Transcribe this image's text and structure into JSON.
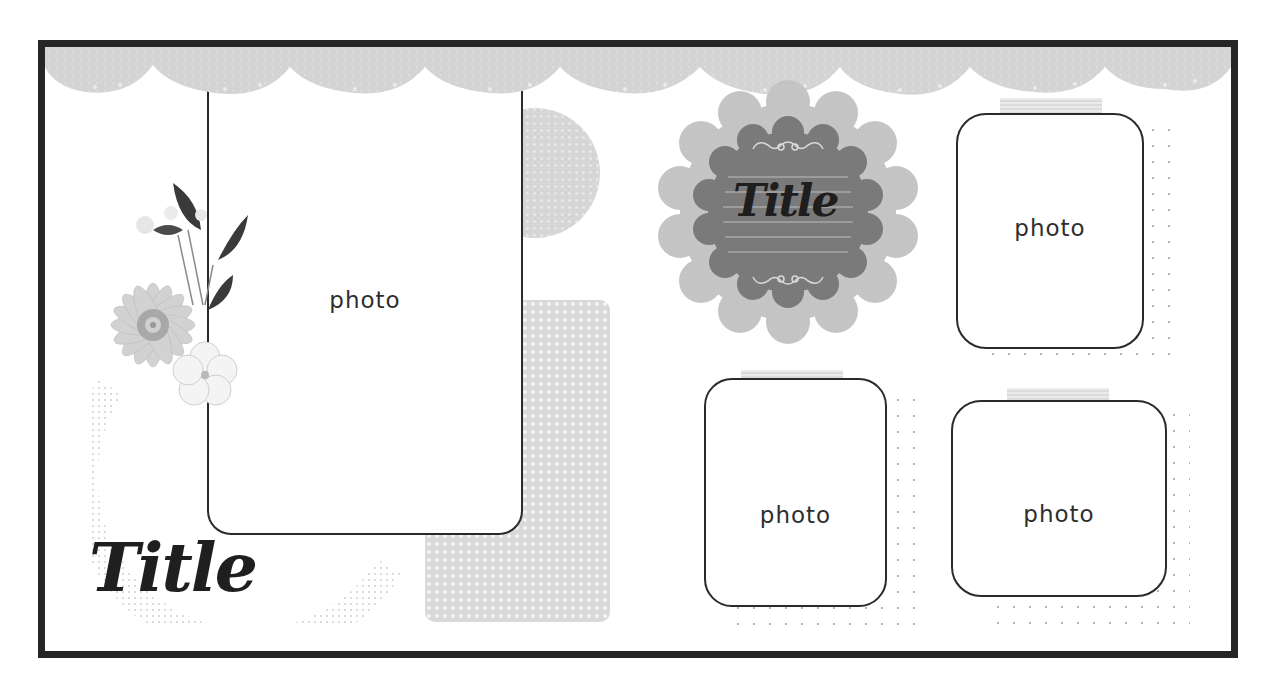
{
  "layout": {
    "name": "scrapbook-sketch-template",
    "colors": {
      "frame_border": "#262626",
      "paper": "#ffffff",
      "lace": "#d4d4d4",
      "badge_outer": "#c2c2c2",
      "badge_inner": "#7a7a7a",
      "badge_lines": "#bdbdbd",
      "photo_border": "#2a2a2a",
      "tape": "#dcdcdc"
    }
  },
  "banner": {
    "scallop_count": 9
  },
  "photos": [
    {
      "id": "photo-large-left",
      "label": "photo"
    },
    {
      "id": "photo-top-right",
      "label": "photo"
    },
    {
      "id": "photo-bottom-middle",
      "label": "photo"
    },
    {
      "id": "photo-bottom-right",
      "label": "photo"
    }
  ],
  "titles": {
    "badge_title": "Title",
    "corner_title": "Title"
  },
  "embellishments": {
    "flower_cluster": "watercolor-flower",
    "flourish_top": "flourish",
    "flourish_bottom": "flourish"
  }
}
